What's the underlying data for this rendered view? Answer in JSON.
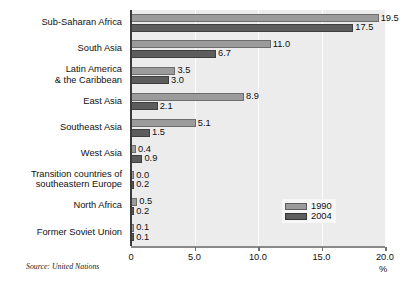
{
  "chart_data": {
    "type": "bar",
    "orientation": "horizontal",
    "title": "",
    "xlabel": "%",
    "ylabel": "",
    "xlim": [
      0,
      20
    ],
    "xticks": [
      "0",
      "5.0",
      "10.0",
      "15.0",
      "20.0"
    ],
    "xtick_values": [
      0,
      5,
      10,
      15,
      20
    ],
    "grid": true,
    "legend_position": "inside-lower-right",
    "categories": [
      "Sub-Saharan Africa",
      "South Asia",
      "Latin America\n& the Caribbean",
      "East Asia",
      "Southeast Asia",
      "West Asia",
      "Transition countries of\nsoutheastern Europe",
      "North Africa",
      "Former Soviet Union"
    ],
    "series": [
      {
        "name": "1990",
        "color": "#9b9b9b",
        "values": [
          19.5,
          11.0,
          3.5,
          8.9,
          5.1,
          0.4,
          0.0,
          0.5,
          0.1
        ],
        "labels": [
          "19.5",
          "11.0",
          "3.5",
          "8.9",
          "5.1",
          "0.4",
          "0.0",
          "0.5",
          "0.1"
        ]
      },
      {
        "name": "2004",
        "color": "#5d5d5d",
        "values": [
          17.5,
          6.7,
          3.0,
          2.1,
          1.5,
          0.9,
          0.2,
          0.2,
          0.1
        ],
        "labels": [
          "17.5",
          "6.7",
          "3.0",
          "2.1",
          "1.5",
          "0.9",
          "0.2",
          "0.2",
          "0.1"
        ]
      }
    ]
  },
  "legend": {
    "items": [
      {
        "label": "1990",
        "color": "#9b9b9b"
      },
      {
        "label": "2004",
        "color": "#5d5d5d"
      }
    ]
  },
  "axis": {
    "unit_label": "%"
  },
  "source": {
    "text": "Source: United Nations"
  }
}
